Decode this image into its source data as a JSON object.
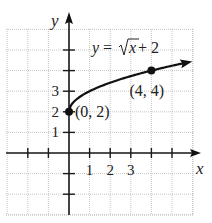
{
  "chart_data": {
    "type": "line",
    "title": "",
    "equation_label": {
      "lhs": "y = ",
      "radical": "x",
      "rhs": " + 2"
    },
    "xlabel": "x",
    "ylabel": "y",
    "xlim": [
      -3,
      6
    ],
    "ylim": [
      -3,
      6
    ],
    "grid": true,
    "x_tick_labels": [
      "1",
      "2",
      "3"
    ],
    "x_tick_values": [
      1,
      2,
      3
    ],
    "x_ticks_all": [
      -2,
      -1,
      1,
      2,
      3,
      4,
      5
    ],
    "y_tick_labels": [
      "1",
      "2",
      "3"
    ],
    "y_tick_values": [
      1,
      2,
      3
    ],
    "y_ticks_all": [
      -2,
      -1,
      1,
      2,
      3,
      4,
      5
    ],
    "series": [
      {
        "name": "y = sqrt(x) + 2",
        "function": "sqrt(x)+2",
        "domain": [
          0,
          5.7
        ],
        "arrow_end": true
      }
    ],
    "points": [
      {
        "x": 0,
        "y": 2,
        "label": "(0, 2)"
      },
      {
        "x": 4,
        "y": 4,
        "label": "(4, 4)"
      }
    ]
  }
}
